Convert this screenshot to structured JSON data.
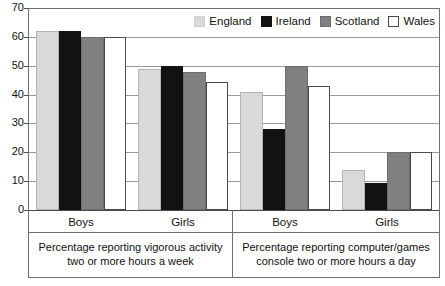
{
  "chart_data": {
    "type": "bar",
    "title": "",
    "subtitle": "",
    "xlabel": "",
    "ylabel": "",
    "ylim": [
      0,
      70
    ],
    "yticks": [
      0,
      10,
      20,
      30,
      40,
      50,
      60,
      70
    ],
    "ytick_labels": [
      "0",
      "10",
      "20",
      "30",
      "40",
      "50",
      "60",
      "70"
    ],
    "grid": true,
    "legend_position": "top-right",
    "categories": [
      "Boys",
      "Girls",
      "Boys",
      "Girls"
    ],
    "panels": [
      {
        "caption_line1": "Percentage reporting vigorous activity",
        "caption_line2": "two or more hours a week",
        "categories": [
          "Boys",
          "Girls"
        ]
      },
      {
        "caption_line1": "Percentage reporting computer/games",
        "caption_line2": "console two or more hours a day",
        "categories": [
          "Boys",
          "Girls"
        ]
      }
    ],
    "series": [
      {
        "name": "England",
        "color": "#d9d9d9",
        "values": [
          62,
          49,
          41,
          14
        ]
      },
      {
        "name": "Ireland",
        "color": "#121212",
        "values": [
          62,
          50,
          28,
          9.5
        ]
      },
      {
        "name": "Scotland",
        "color": "#808080",
        "values": [
          60,
          48,
          50,
          20
        ]
      },
      {
        "name": "Wales",
        "color": "#ffffff",
        "values": [
          60,
          44.5,
          43,
          20
        ]
      }
    ]
  },
  "legend": {
    "items": [
      {
        "label": "England"
      },
      {
        "label": "Ireland"
      },
      {
        "label": "Scotland"
      },
      {
        "label": "Wales"
      }
    ]
  }
}
